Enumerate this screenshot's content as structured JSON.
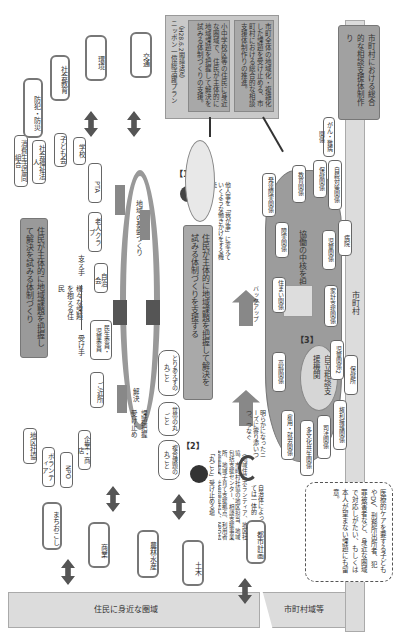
{
  "diagram": {
    "orientation": "rotated 90deg clockwise",
    "bottom_bands": {
      "left": "住民に身近な圏域",
      "middle": "市町村域等",
      "right": "市町村"
    },
    "top_right_box": {
      "title": "ニッポン一億総活躍プラン",
      "subtitle": "（H28.6.2閣議決定）",
      "item1": "小中学校区等の住民に身近な圏域で、住民が主体的に地域課題を把握して解決を試みる体制づくりの支援。",
      "item2": "市町全体の地域化・複雑化した課題を受け止める、市町村における総合的な相談支援体制作りの推進。"
    },
    "right_gray_box": "市町村における総合的な相談支援体制作り",
    "left_fields": [
      "防犯・防災",
      "社会教育",
      "環境",
      "交通",
      "まちおこし",
      "商業",
      "農林水産",
      "土木",
      "都市計画"
    ],
    "community_orgs": [
      "消費生活協同組合",
      "社会福祉法人",
      "子ども会",
      "学校",
      "PTA",
      "老人クラブ",
      "自治会",
      "民生委員・児童委員",
      "ご近所",
      "地区社協",
      "ボランティア",
      "NPO",
      "企業・商店"
    ],
    "section1": {
      "number": "【1】",
      "banner": "住民が主体的に地域課題を把握して解決を試みる体制づくり",
      "caption": "他人事を「我が事」に変えていくような働きかけをする機能",
      "arc_label": "地域の基盤づくり",
      "left_labels": {
        "holder": "様々な課題を抱える住民",
        "receiver": "受け手",
        "supporter": "支え手"
      }
    },
    "section2": {
      "number": "【2】",
      "banner": "住民が主体的に地域課題を把握して解決を試みる体制づくりを支援する",
      "tag1": "複合課題の丸ごと",
      "tag2": "世帯の丸ごと",
      "tag3": "とりあえずの丸ごと",
      "arrow_labels": [
        "課題把握受け止め",
        "解決"
      ],
      "quote": "「丸ごと」受け止める場",
      "quote_detail": "（地域住民ボランティア、地区社協、市町村社協の地区担当、地域包括支援センター、相談支援事業所、地域子育て支援拠点、利用者支援事業、社会福祉法人、NPO法人等）",
      "autonomy": "自治体によっては一体的"
    },
    "section3": {
      "number": "【3】",
      "core": "自立相談支援機関",
      "function": "協働の中核を担う機能",
      "backup": "バックアップ",
      "reveal_text": "明らかになったニーズに寄り添いつつ、つなぐ",
      "agencies": [
        "住まい関係",
        "障害関係",
        "発達障害関係",
        "教育関係",
        "保健関係",
        "がん・難病関係",
        "自殺対策関係",
        "児童関係",
        "病院",
        "家計支援関係",
        "児童関係2",
        "保健所",
        "高齢関係",
        "雇用・就労関係",
        "多文化共生関係",
        "司法関係",
        "権利擁護関係"
      ]
    },
    "note_box": "医療的ケアを要する子どもやDV、刑務所出所者、犯罪被害者など、身近な圏域で対応しがたい、もしくは本人が望まない課題にも留意。"
  }
}
